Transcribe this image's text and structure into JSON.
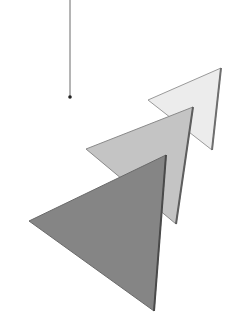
{
  "diagram": {
    "background": "#ffffff",
    "pendulum": {
      "line": {
        "x1": 70,
        "y1": 0,
        "x2": 70,
        "y2": 96,
        "color": "#6a6a6a",
        "width": 1
      },
      "dot": {
        "cx": 70,
        "cy": 97,
        "r": 1.8,
        "color": "#222222"
      }
    },
    "triangles": [
      {
        "name": "light",
        "points": [
          [
            221,
            68
          ],
          [
            148,
            100
          ],
          [
            212,
            150
          ]
        ],
        "fill": "#ececec",
        "stroke": "#9a9a9a",
        "shadow_edge": [
          [
            221,
            68
          ],
          [
            212,
            150
          ]
        ],
        "shadow_color": "#6e6e6e"
      },
      {
        "name": "medium",
        "points": [
          [
            193,
            107
          ],
          [
            86,
            149
          ],
          [
            176,
            224
          ]
        ],
        "fill": "#c4c4c4",
        "stroke": "#8a8a8a",
        "shadow_edge": [
          [
            193,
            107
          ],
          [
            176,
            224
          ]
        ],
        "shadow_color": "#5e5e5e"
      },
      {
        "name": "dark",
        "points": [
          [
            166,
            155
          ],
          [
            29,
            221
          ],
          [
            154,
            311
          ]
        ],
        "fill": "#858585",
        "stroke": "#6a6a6a",
        "shadow_edge": [
          [
            166,
            155
          ],
          [
            154,
            311
          ]
        ],
        "shadow_color": "#4a4a4a"
      }
    ]
  }
}
